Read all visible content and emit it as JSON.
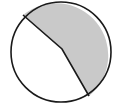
{
  "diagram": {
    "type": "divided-circle",
    "circle": {
      "cx": 61,
      "cy": 52,
      "r": 50
    },
    "divider": {
      "points": [
        [
          23,
          15
        ],
        [
          62,
          49
        ],
        [
          89,
          96
        ]
      ]
    },
    "regions": [
      {
        "name": "shaded",
        "fill": "#c9c9c9"
      },
      {
        "name": "unshaded",
        "fill": "#ffffff"
      }
    ],
    "stroke": "#1a1a1a"
  }
}
